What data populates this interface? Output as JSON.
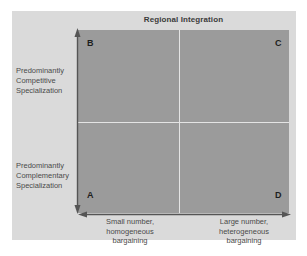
{
  "title": "Regional Integration",
  "quadrants": {
    "top_left": "B",
    "top_right": "C",
    "bottom_left": "A",
    "bottom_right": "D"
  },
  "y_axis": {
    "top_label": [
      "Predominantly",
      "Competitive",
      "Specialization"
    ],
    "bottom_label": [
      "Predominantly",
      "Complementary",
      "Specialization"
    ]
  },
  "x_axis": {
    "left_label": [
      "Small number,",
      "homogeneous",
      "bargaining"
    ],
    "right_label": [
      "Large number,",
      "heterogeneous",
      "bargaining"
    ]
  },
  "colors": {
    "panel": "#dadada",
    "plot": "#9b9b9b",
    "divider": "#e4e4e4",
    "axis": "#555555"
  }
}
